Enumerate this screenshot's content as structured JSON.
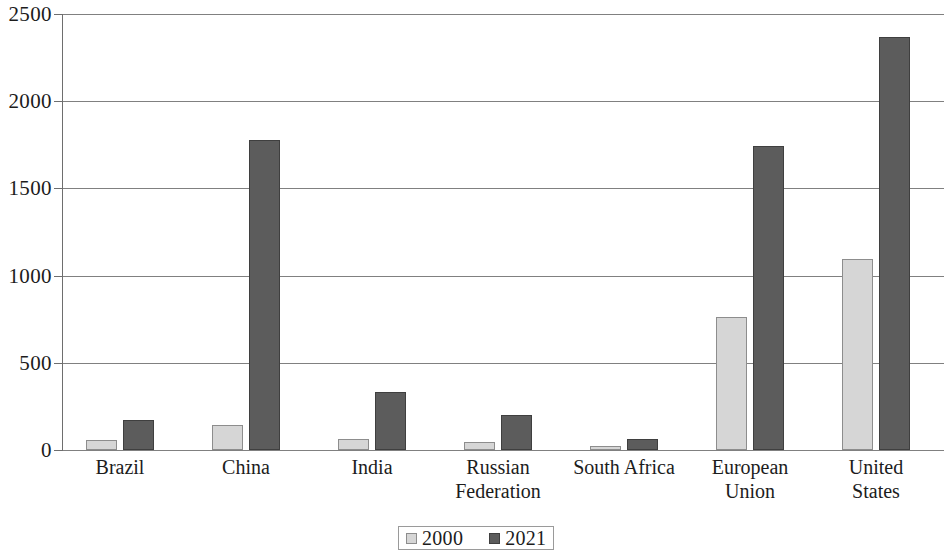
{
  "chart_data": {
    "type": "bar",
    "title": "",
    "subtitle": "",
    "xlabel": "",
    "ylabel": "",
    "ylim": [
      0,
      2500
    ],
    "yticks": [
      0,
      500,
      1000,
      1500,
      2000,
      2500
    ],
    "ytick_labels": [
      "0",
      "500",
      "1000",
      "1500",
      "2000",
      "2500"
    ],
    "grid": true,
    "legend_position": "bottom-center",
    "categories": [
      "Brazil",
      "China",
      "India",
      "Russian\nFederation",
      "South Africa",
      "European\nUnion",
      "United\nStates"
    ],
    "series": [
      {
        "name": "2000",
        "color": "#d6d6d6",
        "border_color": "#8d8d8d",
        "values": [
          60,
          145,
          62,
          45,
          25,
          765,
          1095
        ]
      },
      {
        "name": "2021",
        "color": "#5c5c5c",
        "border_color": "#3f3f3f",
        "values": [
          170,
          1780,
          335,
          200,
          65,
          1745,
          2370
        ]
      }
    ]
  },
  "legend": {
    "items": [
      {
        "label": "2000"
      },
      {
        "label": "2021"
      }
    ]
  },
  "colors": {
    "series_2000": "#d6d6d6",
    "series_2021": "#5c5c5c",
    "gridline": "#808080",
    "axis": "#6e6e6e",
    "text": "#1c1c1c",
    "background": "#ffffff"
  }
}
